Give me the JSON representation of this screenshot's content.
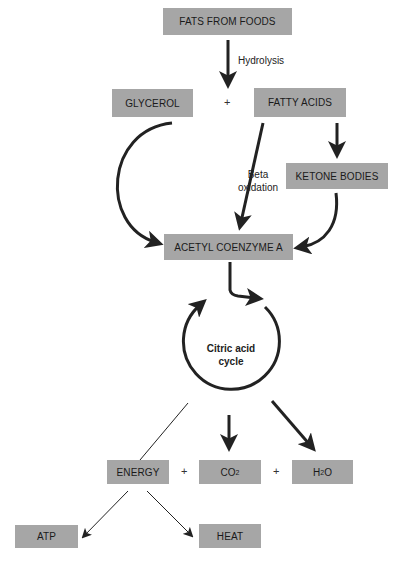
{
  "nodes": {
    "fats": "FATS FROM FOODS",
    "glycerol": "GLYCEROL",
    "fatty_acids": "FATTY ACIDS",
    "ketone": "KETONE BODIES",
    "acetyl": "ACETYL COENZYME A",
    "cycle_line1": "Citric acid",
    "cycle_line2": "cycle",
    "energy": "ENERGY",
    "co2_main": "CO",
    "co2_sub": "2",
    "h2o_h": "H",
    "h2o_sub": "2",
    "h2o_o": "O",
    "atp": "ATP",
    "heat": "HEAT"
  },
  "labels": {
    "hydrolysis": "Hydrolysis",
    "beta_line1": "Beta",
    "beta_line2": "oxidation",
    "plus": "+"
  },
  "colors": {
    "box": "#a6a6a6",
    "arrow": "#222222"
  }
}
